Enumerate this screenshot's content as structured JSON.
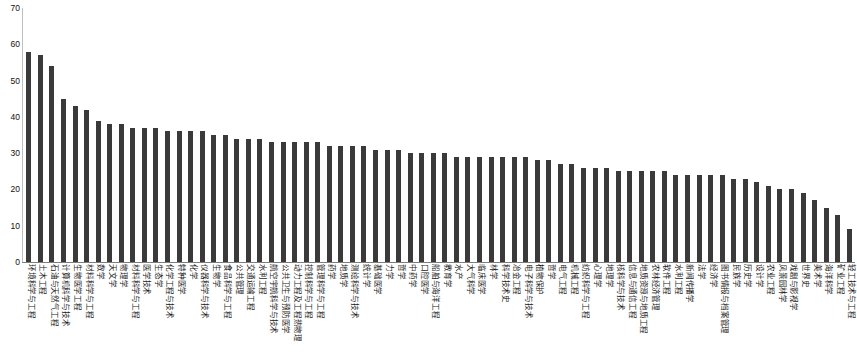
{
  "chart_data": {
    "type": "bar",
    "title": "",
    "subtitle": "",
    "xlabel": "",
    "ylabel": "",
    "ylim": [
      0,
      70
    ],
    "yticks": [
      0,
      10,
      20,
      30,
      40,
      50,
      60,
      70
    ],
    "grid": false,
    "legend": false,
    "bar_color": "#3a3a3a",
    "categories": [
      "环境科学与工程",
      "土木工程",
      "石油与天然气工程",
      "计算机科学与技术",
      "生物医学工程",
      "材料科学与工程",
      "数学",
      "天文学",
      "物理学",
      "材料科学与工程",
      "医学技术",
      "生态学",
      "化学工程与技术",
      "特种医学",
      "化学",
      "仪器科学与技术",
      "生物学",
      "食品科学与工程",
      "公共管理",
      "交通运输工程",
      "水利工程",
      "航空宇航科学与技术",
      "公共卫生与预防医学",
      "动力工程及工程热物理",
      "控制科学与工程",
      "管理科学与工程",
      "药学",
      "地质学",
      "测绘科学与技术",
      "统计学",
      "基础医学",
      "力学",
      "哲学",
      "中药学",
      "口腔医学",
      "船舶与海洋工程",
      "教育学",
      "水产",
      "大气科学",
      "临床医学",
      "林学",
      "科学技术史",
      "冶金工程",
      "电子科学与技术",
      "植物保护",
      "哲学",
      "电气工程",
      "机械工程",
      "纺织科学与工程",
      "心理学",
      "地理学",
      "核科学与技术",
      "信息与通信工程",
      "地质资源与地质工程",
      "农林经济管理",
      "软件工程",
      "水利工程",
      "新闻传播学",
      "法学",
      "经济学",
      "图书情报与档案管理",
      "民族学",
      "历史学",
      "设计学",
      "农业工程",
      "风景园林学",
      "戏剧与影视学",
      "世界史",
      "美术学",
      "海洋科学",
      "矿业工程",
      "轻工技术与工程"
    ],
    "values": [
      58,
      57,
      54,
      45,
      43,
      42,
      39,
      38,
      38,
      37,
      37,
      37,
      36,
      36,
      36,
      36,
      35,
      35,
      34,
      34,
      34,
      33,
      33,
      33,
      33,
      33,
      32,
      32,
      32,
      32,
      31,
      31,
      31,
      30,
      30,
      30,
      30,
      29,
      29,
      29,
      29,
      29,
      29,
      29,
      28,
      28,
      27,
      27,
      26,
      26,
      26,
      25,
      25,
      25,
      25,
      25,
      24,
      24,
      24,
      24,
      24,
      23,
      23,
      22,
      21,
      20,
      20,
      19,
      17,
      15,
      13,
      9
    ]
  }
}
